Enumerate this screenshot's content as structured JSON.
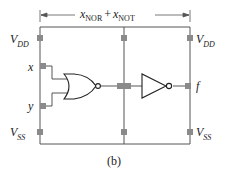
{
  "diagram": {
    "dimension_label": {
      "var1": "x",
      "sub1": "NOR",
      "plus": "+",
      "var2": "x",
      "sub2": "NOT"
    },
    "rails": {
      "vdd_left": {
        "main": "V",
        "sub": "DD"
      },
      "vdd_right": {
        "main": "V",
        "sub": "DD"
      },
      "vss_left": {
        "main": "V",
        "sub": "SS"
      },
      "vss_right": {
        "main": "V",
        "sub": "SS"
      }
    },
    "pins": {
      "input_x": "x",
      "input_y": "y",
      "output_f": "f"
    },
    "gates": [
      "NOR",
      "NOT"
    ],
    "caption": "(b)",
    "colors": {
      "line": "#555555",
      "pin": "#8a8a8a",
      "text": "#222222"
    }
  }
}
